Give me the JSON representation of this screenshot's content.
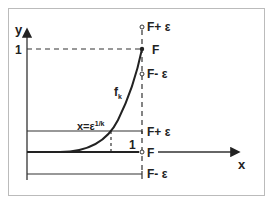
{
  "diagram": {
    "axes": {
      "x_label": "x",
      "y_label": "y",
      "y_tick_one": "1",
      "x_tick_one": "1"
    },
    "curve": {
      "label": "f",
      "subscript": "k"
    },
    "intersection": {
      "label_base": "x=ε",
      "label_exp": "1/k"
    },
    "upper_band": {
      "plus": "F+ ε",
      "center": "F",
      "minus": "F- ε"
    },
    "lower_band": {
      "plus": "F+ ε",
      "center": "F",
      "minus": "F- ε"
    },
    "colors": {
      "line": "#333333",
      "frame": "#bbbbbb",
      "background": "#ffffff"
    }
  }
}
